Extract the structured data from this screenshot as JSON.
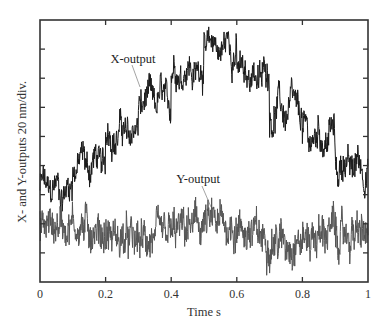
{
  "chart_data": {
    "type": "line",
    "title": "",
    "xlabel": "Time  s",
    "ylabel": "X- and Y-outputs 20 nm/div.",
    "xlim": [
      0,
      1
    ],
    "ylim": [
      0,
      9
    ],
    "y_units_per_div": "20 nm",
    "x_ticks": [
      "0",
      "0.2",
      "0.4",
      "0.6",
      "0.8",
      "1"
    ],
    "x_tick_values": [
      0,
      0.2,
      0.4,
      0.6,
      0.8,
      1.0
    ],
    "y_ticks_count": 8,
    "y_tick_labels": [],
    "grid": false,
    "legend": null,
    "annotations": [
      {
        "text": "X-output",
        "x": 0.2,
        "y_div": 7.9,
        "points_to_series": "X-output"
      },
      {
        "text": "Y-output",
        "x": 0.43,
        "y_div": 3.7,
        "points_to_series": "Y-output"
      }
    ],
    "series": [
      {
        "name": "X-output",
        "color": "#1a1a1a",
        "description": "Staircase: 10 steps of 0.1 s each, rising then falling, with noise ~±0.5 div",
        "step_times": [
          0.0,
          0.1,
          0.2,
          0.3,
          0.4,
          0.5,
          0.6,
          0.7,
          0.8,
          0.9
        ],
        "step_levels_div": [
          3.2,
          4.1,
          5.1,
          6.2,
          7.3,
          8.1,
          7.1,
          5.9,
          5.0,
          4.0
        ],
        "noise_div": 0.5
      },
      {
        "name": "Y-output",
        "color": "#555555",
        "description": "Noisy near-constant signal",
        "mean_level_div": 1.7,
        "noise_div": 0.7
      }
    ]
  },
  "labels": {
    "x_axis_title": "Time  s",
    "y_axis_title": "X- and Y-outputs 20 nm/div.",
    "x_output": "X-output",
    "y_output": "Y-output"
  }
}
